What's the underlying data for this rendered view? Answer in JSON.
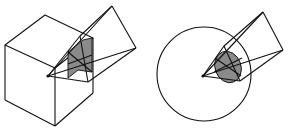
{
  "figure": {
    "panels": [
      {
        "id": "cube-panel",
        "description": "Cube with a solid-angle cone from its vertex; shaded spherical/planar section"
      },
      {
        "id": "sphere-panel",
        "description": "Sphere with cone from its center; shaded circular cap section"
      }
    ],
    "colors": {
      "line": "#111111",
      "shade": "#8a8a8a",
      "background": "#ffffff"
    }
  }
}
